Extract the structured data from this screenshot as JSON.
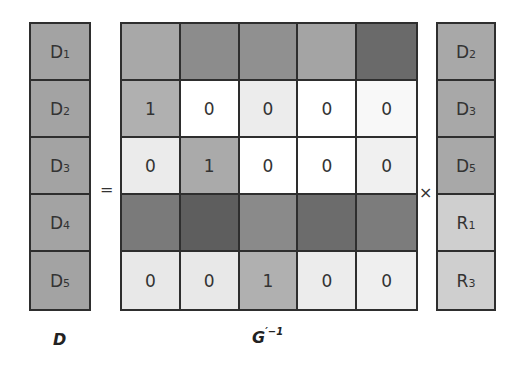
{
  "left_vector": {
    "label": "D",
    "cells": [
      {
        "base": "D",
        "sub": "1",
        "color": "#a3a3a3"
      },
      {
        "base": "D",
        "sub": "2",
        "color": "#a3a3a3"
      },
      {
        "base": "D",
        "sub": "3",
        "color": "#a3a3a3"
      },
      {
        "base": "D",
        "sub": "4",
        "color": "#a3a3a3"
      },
      {
        "base": "D",
        "sub": "5",
        "color": "#a3a3a3"
      }
    ]
  },
  "operators": {
    "equals": "=",
    "times": "×"
  },
  "matrix": {
    "label_base": "G",
    "label_sup": "′−1",
    "rows": [
      [
        {
          "v": "",
          "c": "#a8a8a8"
        },
        {
          "v": "",
          "c": "#8c8c8c"
        },
        {
          "v": "",
          "c": "#909090"
        },
        {
          "v": "",
          "c": "#a4a4a4"
        },
        {
          "v": "",
          "c": "#6a6a6a"
        }
      ],
      [
        {
          "v": "1",
          "c": "#b0b0b0"
        },
        {
          "v": "0",
          "c": "#ffffff"
        },
        {
          "v": "0",
          "c": "#ececec"
        },
        {
          "v": "0",
          "c": "#ffffff"
        },
        {
          "v": "0",
          "c": "#f8f8f8"
        }
      ],
      [
        {
          "v": "0",
          "c": "#ebebeb"
        },
        {
          "v": "1",
          "c": "#aaaaaa"
        },
        {
          "v": "0",
          "c": "#ffffff"
        },
        {
          "v": "0",
          "c": "#ffffff"
        },
        {
          "v": "0",
          "c": "#f0f0f0"
        }
      ],
      [
        {
          "v": "",
          "c": "#7a7a7a"
        },
        {
          "v": "",
          "c": "#5e5e5e"
        },
        {
          "v": "",
          "c": "#8a8a8a"
        },
        {
          "v": "",
          "c": "#6c6c6c"
        },
        {
          "v": "",
          "c": "#7c7c7c"
        }
      ],
      [
        {
          "v": "0",
          "c": "#e8e8e8"
        },
        {
          "v": "0",
          "c": "#e8e8e8"
        },
        {
          "v": "1",
          "c": "#b0b0b0"
        },
        {
          "v": "0",
          "c": "#ececec"
        },
        {
          "v": "0",
          "c": "#efefef"
        }
      ]
    ]
  },
  "right_vector": {
    "cells": [
      {
        "base": "D",
        "sub": "2",
        "color": "#a8a8a8"
      },
      {
        "base": "D",
        "sub": "3",
        "color": "#a8a8a8"
      },
      {
        "base": "D",
        "sub": "5",
        "color": "#a8a8a8"
      },
      {
        "base": "R",
        "sub": "1",
        "color": "#cfcfcf"
      },
      {
        "base": "R",
        "sub": "3",
        "color": "#cfcfcf"
      }
    ]
  }
}
